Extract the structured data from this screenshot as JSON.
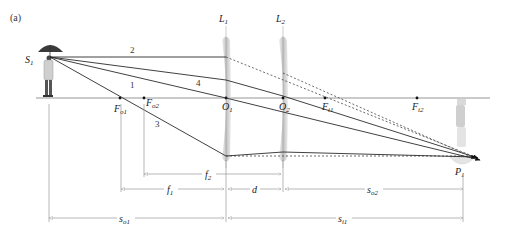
{
  "figure": {
    "panel_label": "(a)",
    "lenses": [
      {
        "name": "L",
        "sub": "1",
        "center_label": "O",
        "center_sub": "1"
      },
      {
        "name": "L",
        "sub": "2",
        "center_label": "O",
        "center_sub": "2"
      }
    ],
    "object_label": {
      "name": "S",
      "sub": "1"
    },
    "image_label": {
      "name": "P",
      "sub": "1"
    },
    "focal_points": [
      {
        "name": "F",
        "sub": "o1"
      },
      {
        "name": "F",
        "sub": "o2"
      },
      {
        "name": "F",
        "sub": "i1"
      },
      {
        "name": "F",
        "sub": "i2"
      }
    ],
    "ray_numbers": [
      "1",
      "2",
      "3",
      "4"
    ],
    "dimensions": [
      {
        "name": "f",
        "sub": "2"
      },
      {
        "name": "f",
        "sub": "1"
      },
      {
        "name": "d",
        "sub": ""
      },
      {
        "name": "s",
        "sub": "o2"
      },
      {
        "name": "s",
        "sub": "o1"
      },
      {
        "name": "s",
        "sub": "i1"
      }
    ],
    "colors": {
      "ray": "#2b2b2b",
      "axis": "#8a8a8a",
      "dimension": "#9a9a9a",
      "lens": "#b5b5b5"
    }
  }
}
